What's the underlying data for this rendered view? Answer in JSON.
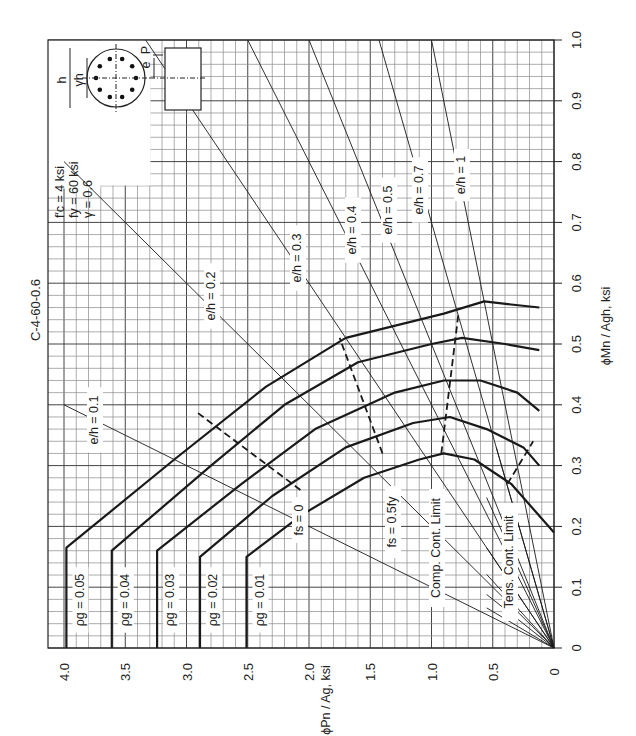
{
  "chart_data": {
    "type": "line",
    "title": "C-4-60-0.6",
    "orientation": "rotated 90° counter-clockwise (moment axis vertical on right, axial axis horizontal on bottom)",
    "xlabel": "ϕMn / Ag h, ksi",
    "ylabel": "ϕPn / Ag, ksi",
    "xlim": [
      0,
      1.0
    ],
    "ylim": [
      0,
      4.0
    ],
    "x_ticks": [
      "0",
      "0.1",
      "0.2",
      "0.3",
      "0.4",
      "0.5",
      "0.6",
      "0.7",
      "0.8",
      "0.9",
      "1.0"
    ],
    "y_ticks": [
      "0",
      "0.5",
      "1.0",
      "1.5",
      "2.0",
      "2.5",
      "3.0",
      "3.5",
      "4.0"
    ],
    "grid": true,
    "parameters": {
      "fc": "f'c = 4 ksi",
      "fy": "fy = 60 ksi",
      "gamma": "γ = 0.6"
    },
    "inset_labels": {
      "h": "h",
      "gamma_h": "γh",
      "e": "e",
      "P": "P"
    },
    "series": [
      {
        "name": "ρg = 0.01",
        "points": [
          [
            0,
            2.51
          ],
          [
            0.15,
            2.51
          ],
          [
            0.22,
            2.05
          ],
          [
            0.28,
            1.55
          ],
          [
            0.31,
            1.1
          ],
          [
            0.32,
            0.9
          ],
          [
            0.31,
            0.65
          ],
          [
            0.27,
            0.35
          ],
          [
            0.19,
            0
          ]
        ]
      },
      {
        "name": "ρg = 0.02",
        "points": [
          [
            0,
            2.89
          ],
          [
            0.15,
            2.89
          ],
          [
            0.25,
            2.3
          ],
          [
            0.33,
            1.7
          ],
          [
            0.37,
            1.15
          ],
          [
            0.38,
            0.85
          ],
          [
            0.36,
            0.55
          ],
          [
            0.33,
            0.25
          ],
          [
            0.3,
            0.12
          ]
        ]
      },
      {
        "name": "ρg = 0.03",
        "points": [
          [
            0,
            3.24
          ],
          [
            0.16,
            3.24
          ],
          [
            0.27,
            2.55
          ],
          [
            0.36,
            1.95
          ],
          [
            0.42,
            1.3
          ],
          [
            0.44,
            0.9
          ],
          [
            0.44,
            0.6
          ],
          [
            0.42,
            0.3
          ],
          [
            0.39,
            0.12
          ]
        ]
      },
      {
        "name": "ρg = 0.04",
        "points": [
          [
            0,
            3.61
          ],
          [
            0.16,
            3.61
          ],
          [
            0.3,
            2.8
          ],
          [
            0.4,
            2.2
          ],
          [
            0.47,
            1.6
          ],
          [
            0.5,
            1.0
          ],
          [
            0.51,
            0.75
          ],
          [
            0.5,
            0.4
          ],
          [
            0.49,
            0.12
          ]
        ]
      },
      {
        "name": "ρg = 0.05",
        "points": [
          [
            0,
            3.98
          ],
          [
            0.165,
            3.98
          ],
          [
            0.31,
            3.1
          ],
          [
            0.43,
            2.35
          ],
          [
            0.51,
            1.7
          ],
          [
            0.55,
            0.9
          ],
          [
            0.57,
            0.57
          ],
          [
            0.565,
            0.35
          ],
          [
            0.56,
            0.12
          ]
        ]
      }
    ],
    "eccentricity_lines": [
      {
        "label": "e/h = 0.1",
        "slope_Mn_over_Pn": 0.1
      },
      {
        "label": "e/h = 0.2",
        "slope_Mn_over_Pn": 0.2
      },
      {
        "label": "e/h = 0.3",
        "slope_Mn_over_Pn": 0.3
      },
      {
        "label": "e/h = 0.4",
        "slope_Mn_over_Pn": 0.4
      },
      {
        "label": "e/h = 0.5",
        "slope_Mn_over_Pn": 0.5
      },
      {
        "label": "e/h = 0.7",
        "slope_Mn_over_Pn": 0.7
      },
      {
        "label": "e/h = 1",
        "slope_Mn_over_Pn": 1.0
      }
    ],
    "strain_lines": [
      {
        "label": "fs = 0",
        "points": [
          [
            0.26,
            2.07
          ],
          [
            0.39,
            2.93
          ]
        ]
      },
      {
        "label": "fs = 0.5fy",
        "points": [
          [
            0.32,
            1.4
          ],
          [
            0.51,
            1.75
          ]
        ]
      },
      {
        "label": "Comp. Cont. Limit",
        "points": [
          [
            0.32,
            0.92
          ],
          [
            0.55,
            0.78
          ]
        ]
      },
      {
        "label": "Tens. Cont. Limit",
        "points": [
          [
            0.27,
            0.38
          ],
          [
            0.34,
            0.17
          ]
        ]
      }
    ],
    "annotations": [
      "ρg = 0.01",
      "ρg = 0.02",
      "ρg = 0.03",
      "ρg = 0.04",
      "ρg = 0.05",
      "fs = 0",
      "fs = 0.5fy",
      "Comp. Cont. Limit",
      "Tens. Cont. Limit"
    ]
  },
  "labels": {
    "title": "C-4-60-0.6",
    "fc": "f′c = 4 ksi",
    "fy": "fy = 60 ksi",
    "gamma": "γ = 0.6",
    "xaxis": "ϕMn / Agh, ksi",
    "yaxis": "ϕPn / Ag, ksi",
    "fs0": "fs = 0",
    "fs05": "fs = 0.5fy",
    "comp": "Comp. Cont. Limit",
    "tens": "Tens. Cont. Limit",
    "h": "h",
    "gh": "γh",
    "e": "e",
    "P": "P"
  }
}
